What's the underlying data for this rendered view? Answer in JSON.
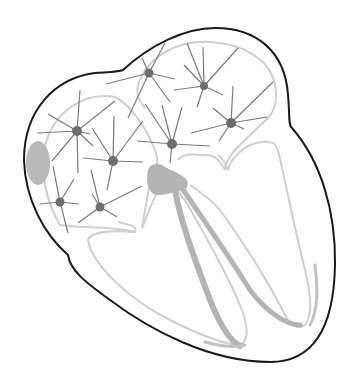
{
  "diagram": {
    "colors": {
      "outline": "#1a1a1a",
      "inner_wall": "#cfcfcf",
      "conduction": "#b4b4b4",
      "node": "#6e6e6e",
      "spoke": "#7a7a7a",
      "background": "#ffffff"
    },
    "ectopic_foci": [
      {
        "id": "focus-1",
        "x": 149,
        "y": 73
      },
      {
        "id": "focus-2",
        "x": 204,
        "y": 86
      },
      {
        "id": "focus-3",
        "x": 231,
        "y": 123
      },
      {
        "id": "focus-4",
        "x": 172,
        "y": 144
      },
      {
        "id": "focus-5",
        "x": 77,
        "y": 131
      },
      {
        "id": "focus-6",
        "x": 113,
        "y": 161
      },
      {
        "id": "focus-7",
        "x": 60,
        "y": 202
      },
      {
        "id": "focus-8",
        "x": 100,
        "y": 207
      }
    ],
    "structures": [
      {
        "name": "sinoatrial-node",
        "x": 38,
        "y": 163
      },
      {
        "name": "atrioventricular-node",
        "x": 160,
        "y": 178
      },
      {
        "name": "bundle-branches",
        "x": 200,
        "y": 260
      }
    ]
  }
}
